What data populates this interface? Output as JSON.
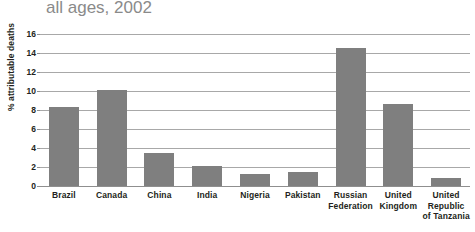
{
  "chart_data": {
    "type": "bar",
    "title": "all ages, 2002",
    "title_line1": "",
    "xlabel": "",
    "ylabel": "% attributable deaths",
    "ylim": [
      0,
      16
    ],
    "yticks": [
      0,
      2,
      4,
      6,
      8,
      10,
      12,
      14,
      16
    ],
    "grid": true,
    "legend": "none",
    "bar_color": "#7f7f7f",
    "categories": [
      "Brazil",
      "Canada",
      "China",
      "India",
      "Nigeria",
      "Pakistan",
      "Russian Federation",
      "United Kingdom",
      "United Republic of Tanzania"
    ],
    "category_lines": [
      [
        "Brazil"
      ],
      [
        "Canada"
      ],
      [
        "China"
      ],
      [
        "India"
      ],
      [
        "Nigeria"
      ],
      [
        "Pakistan"
      ],
      [
        "Russian",
        "Federation"
      ],
      [
        "United",
        "Kingdom"
      ],
      [
        "United",
        "Republic",
        "of Tanzania"
      ]
    ],
    "values": [
      8.3,
      10.1,
      3.5,
      2.1,
      1.3,
      1.5,
      14.5,
      8.6,
      0.8
    ],
    "series": [
      {
        "name": "% attributable deaths",
        "values": [
          8.3,
          10.1,
          3.5,
          2.1,
          1.3,
          1.5,
          14.5,
          8.6,
          0.8
        ]
      }
    ]
  }
}
